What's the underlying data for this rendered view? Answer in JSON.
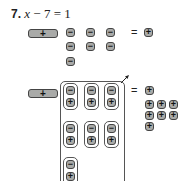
{
  "problem": {
    "number": "7.",
    "equation_var": "x",
    "equation_rest": " − 7 = 1"
  },
  "top_model": {
    "x_tile_label": "+",
    "negative_tiles": [
      "−",
      "−",
      "−",
      "−",
      "−",
      "−",
      "−"
    ],
    "equals": "=",
    "right_tiles": [
      "+"
    ]
  },
  "bottom_model": {
    "x_tile_label": "+",
    "zero_pairs": [
      {
        "top": "−",
        "bottom": "+"
      },
      {
        "top": "−",
        "bottom": "+"
      },
      {
        "top": "−",
        "bottom": "+"
      },
      {
        "top": "−",
        "bottom": "+"
      },
      {
        "top": "−",
        "bottom": "+"
      },
      {
        "top": "−",
        "bottom": "+"
      },
      {
        "top": "−",
        "bottom": "+"
      }
    ],
    "equals": "=",
    "right_tiles": [
      "+",
      "+",
      "+",
      "+",
      "+",
      "+",
      "+",
      "+"
    ]
  },
  "colors": {
    "tile_fill": "#a9aaa8",
    "tile_border": "#444444"
  }
}
